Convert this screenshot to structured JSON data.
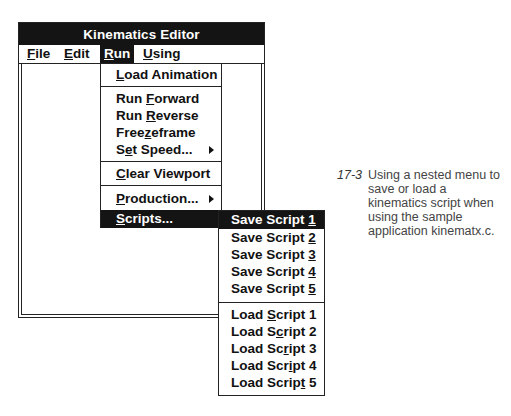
{
  "window": {
    "title": "Kinematics Editor"
  },
  "menubar": {
    "items": [
      {
        "label": "File",
        "mnemonic": "F",
        "rest": "ile",
        "active": false
      },
      {
        "label": "Edit",
        "mnemonic": "E",
        "rest": "dit",
        "active": false
      },
      {
        "label": "Run",
        "mnemonic": "R",
        "rest": "un",
        "active": true
      },
      {
        "label": "Using",
        "mnemonic": "U",
        "rest": "sing",
        "active": false
      }
    ]
  },
  "run_menu": {
    "items": [
      {
        "label": "Load Animation",
        "pre": "",
        "mn": "L",
        "post": "oad Animation"
      },
      {
        "label": "Run Forward",
        "pre": "Run ",
        "mn": "F",
        "post": "orward"
      },
      {
        "label": "Run Reverse",
        "pre": "Run ",
        "mn": "R",
        "post": "everse"
      },
      {
        "label": "Freezeframe",
        "pre": "Free",
        "mn": "z",
        "post": "eframe"
      },
      {
        "label": "Set Speed...",
        "pre": "S",
        "mn": "e",
        "post": "t Speed...",
        "submenu": true
      },
      {
        "label": "Clear Viewport",
        "pre": "",
        "mn": "C",
        "post": "lear Viewport"
      },
      {
        "label": "Production...",
        "pre": "",
        "mn": "P",
        "post": "roduction...",
        "submenu": true
      },
      {
        "label": "Scripts...",
        "pre": "",
        "mn": "S",
        "post": "cripts...",
        "submenu": true,
        "selected": true
      }
    ]
  },
  "scripts_submenu": {
    "save_items": [
      {
        "label": "Save Script 1",
        "pre": "Save Script ",
        "mn": "1",
        "post": "",
        "selected": true
      },
      {
        "label": "Save Script 2",
        "pre": "Save Script ",
        "mn": "2",
        "post": ""
      },
      {
        "label": "Save Script 3",
        "pre": "Save Script ",
        "mn": "3",
        "post": ""
      },
      {
        "label": "Save Script 4",
        "pre": "Save Script ",
        "mn": "4",
        "post": ""
      },
      {
        "label": "Save Script 5",
        "pre": "Save Script ",
        "mn": "5",
        "post": ""
      }
    ],
    "load_items": [
      {
        "label": "Load Script 1",
        "pre": "Load ",
        "mn": "S",
        "post": "cript 1"
      },
      {
        "label": "Load Script 2",
        "pre": "Load S",
        "mn": "c",
        "post": "ript 2"
      },
      {
        "label": "Load Script 3",
        "pre": "Load Sc",
        "mn": "r",
        "post": "ipt 3"
      },
      {
        "label": "Load Script 4",
        "pre": "Load Scr",
        "mn": "i",
        "post": "pt 4"
      },
      {
        "label": "Load Script 5",
        "pre": "Load Scrip",
        "mn": "t",
        "post": " 5"
      }
    ]
  },
  "caption": {
    "number": "17-3",
    "text": "Using a nested menu to save or load a kinematics script when using the sample application kinematx.c."
  }
}
